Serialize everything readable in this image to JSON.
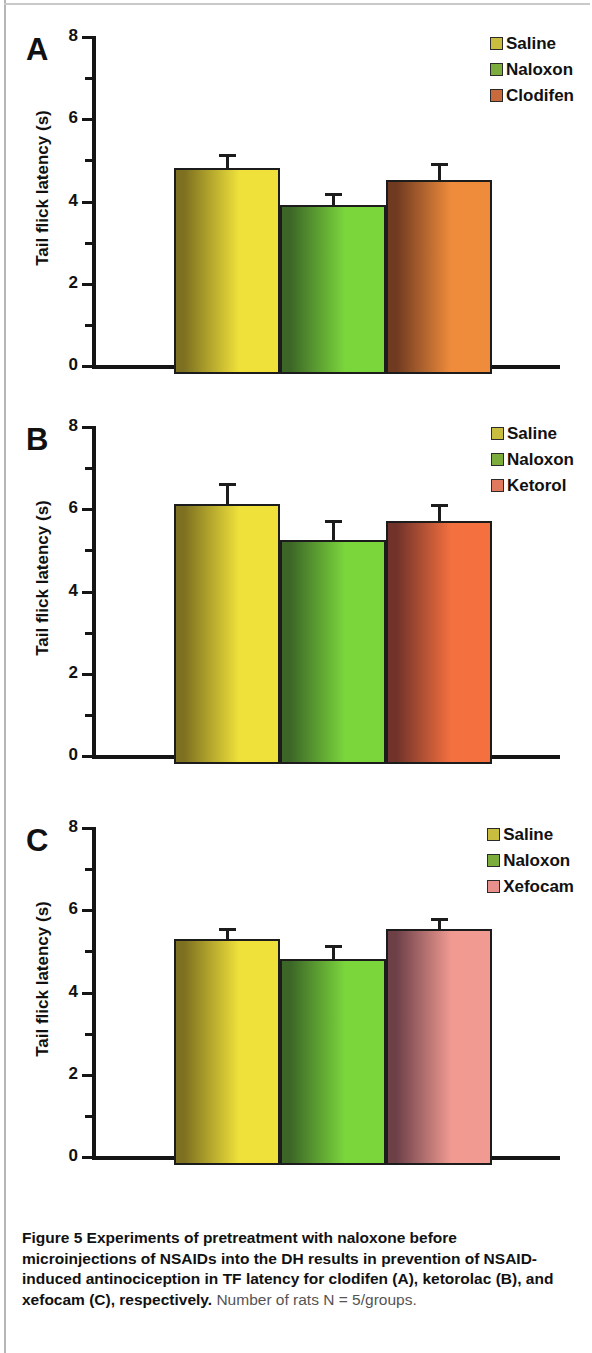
{
  "figure": {
    "caption_bold": "Figure 5 Experiments of pretreatment with naloxone before microinjections of NSAIDs into the DH results in prevention of NSAID-induced antinociception in TF latency for clodifen (A), ketorolac (B), and xefocam (C), respectively.",
    "caption_tail": " Number of rats N = 5/groups."
  },
  "axis": {
    "y_title": "Tail flick latency (s)",
    "tick_labels": [
      "8",
      "6",
      "4",
      "2",
      "0"
    ]
  },
  "colors": {
    "saline": "#efe13a",
    "saline_dark": "#7d7020",
    "naloxon": "#7bd63c",
    "naloxon_dark": "#3c6626",
    "clodifen": "#ef8c3c",
    "clodifen_dark": "#6f3a20",
    "ketorol": "#f4703f",
    "ketorol_dark": "#70322a",
    "xefocam": "#f09a92",
    "xefocam_dark": "#6d4048",
    "legend_saline": "#c8bd3e",
    "legend_naloxon": "#7bac3c",
    "legend_clodifen": "#c96a3c",
    "legend_ketorol": "#e07a5f",
    "legend_xefocam": "#e8918c",
    "axis": "#151515"
  },
  "chart_data": [
    {
      "type": "bar",
      "panel": "A",
      "title": "",
      "xlabel": "",
      "ylabel": "Tail flick latency (s)",
      "ylim": [
        0,
        8
      ],
      "yticks": [
        0,
        2,
        4,
        6,
        8
      ],
      "yticks_minor": [
        1,
        3,
        5,
        7
      ],
      "grid": false,
      "legend_position": "top-right",
      "categories": [
        "Saline",
        "Naloxon",
        "Clodifen"
      ],
      "values": [
        5.0,
        4.1,
        4.72
      ],
      "errors": [
        0.27,
        0.24,
        0.34
      ],
      "legend": [
        "Saline",
        "Naloxon",
        "Clodifen"
      ]
    },
    {
      "type": "bar",
      "panel": "B",
      "title": "",
      "xlabel": "",
      "ylabel": "Tail flick latency (s)",
      "ylim": [
        0,
        8
      ],
      "yticks": [
        0,
        2,
        4,
        6,
        8
      ],
      "yticks_minor": [
        1,
        3,
        5,
        7
      ],
      "grid": false,
      "legend_position": "top-right",
      "categories": [
        "Saline",
        "Naloxon",
        "Ketorol"
      ],
      "values": [
        6.33,
        5.45,
        5.92
      ],
      "errors": [
        0.43,
        0.4,
        0.32
      ],
      "legend": [
        "Saline",
        "Naloxon",
        "Ketorol"
      ]
    },
    {
      "type": "bar",
      "panel": "C",
      "title": "",
      "xlabel": "",
      "ylabel": "Tail flick latency (s)",
      "ylim": [
        0,
        8
      ],
      "yticks": [
        0,
        2,
        4,
        6,
        8
      ],
      "yticks_minor": [
        1,
        3,
        5,
        7
      ],
      "grid": false,
      "legend_position": "top-right",
      "categories": [
        "Saline",
        "Naloxon",
        "Xefocam"
      ],
      "values": [
        5.5,
        5.0,
        5.73
      ],
      "errors": [
        0.2,
        0.28,
        0.2
      ],
      "legend": [
        "Saline",
        "Naloxon",
        "Xefocam"
      ]
    }
  ],
  "panels": [
    {
      "letter": "A",
      "legend": [
        {
          "label": "Saline",
          "swatch": "#c8bd3e"
        },
        {
          "label": "Naloxon",
          "swatch": "#7bac3c"
        },
        {
          "label": "Clodifen",
          "swatch": "#c96a3c"
        }
      ]
    },
    {
      "letter": "B",
      "legend": [
        {
          "label": "Saline",
          "swatch": "#c8bd3e"
        },
        {
          "label": "Naloxon",
          "swatch": "#7bac3c"
        },
        {
          "label": "Ketorol",
          "swatch": "#e07a5f"
        }
      ]
    },
    {
      "letter": "C",
      "legend": [
        {
          "label": "Saline",
          "swatch": "#c8bd3e"
        },
        {
          "label": "Naloxon",
          "swatch": "#7bac3c"
        },
        {
          "label": "Xefocam",
          "swatch": "#e8918c"
        }
      ]
    }
  ]
}
